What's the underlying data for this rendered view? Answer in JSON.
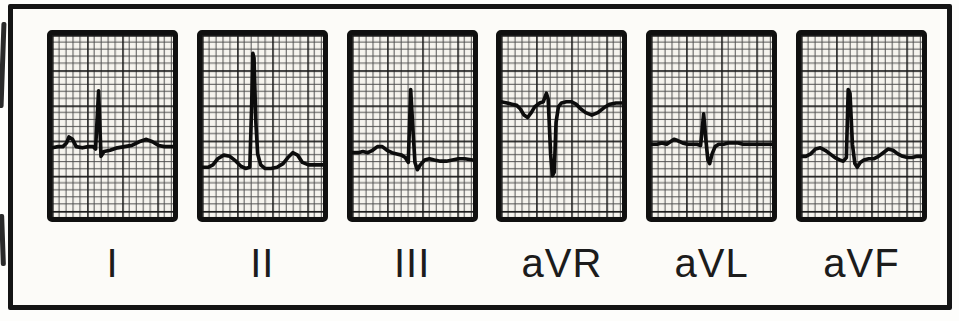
{
  "figure": {
    "colors": {
      "page_background": "#fdfdfb",
      "frame_border": "#141414",
      "frame_background": "#fcfbf8",
      "paper": "#f6f4ee",
      "grid_minor": "#4b4b4b",
      "grid_major": "#1a1a1a",
      "trace": "#0c0c0c",
      "panel_border": "#101010",
      "label_text": "#1c1c1c"
    }
  },
  "chart_data": {
    "type": "line",
    "legend_position": "below-each-panel",
    "grid": {
      "style": "ecg graph paper",
      "viewbox": [
        100,
        150
      ],
      "minor_step_units": 5.8,
      "major_every_minor": 5
    },
    "leads": [
      {
        "label": "I",
        "qrs_polarity": "positive",
        "points": [
          [
            0,
            93
          ],
          [
            5,
            92
          ],
          [
            9,
            92
          ],
          [
            12,
            89
          ],
          [
            14,
            84
          ],
          [
            17,
            86
          ],
          [
            20,
            92
          ],
          [
            25,
            93
          ],
          [
            30,
            92
          ],
          [
            34,
            92
          ],
          [
            36,
            94
          ],
          [
            38.5,
            46
          ],
          [
            40.5,
            100
          ],
          [
            43,
            96
          ],
          [
            48,
            95
          ],
          [
            54,
            93
          ],
          [
            60,
            92
          ],
          [
            66,
            91
          ],
          [
            72,
            88
          ],
          [
            78,
            86
          ],
          [
            83,
            88
          ],
          [
            88,
            91
          ],
          [
            93,
            92
          ],
          [
            100,
            92
          ]
        ]
      },
      {
        "label": "II",
        "qrs_polarity": "positive",
        "points": [
          [
            0,
            109
          ],
          [
            5,
            109
          ],
          [
            9,
            107
          ],
          [
            13,
            102
          ],
          [
            18,
            99
          ],
          [
            23,
            100
          ],
          [
            28,
            104
          ],
          [
            32,
            108
          ],
          [
            36,
            110
          ],
          [
            39.5,
            109
          ],
          [
            41,
            60
          ],
          [
            42,
            15
          ],
          [
            43,
            19
          ],
          [
            44.5,
            72
          ],
          [
            46,
            98
          ],
          [
            48.5,
            107
          ],
          [
            52,
            110
          ],
          [
            57,
            110
          ],
          [
            62,
            109
          ],
          [
            67,
            106
          ],
          [
            71,
            101
          ],
          [
            75,
            97
          ],
          [
            79,
            99
          ],
          [
            83,
            105
          ],
          [
            88,
            107
          ],
          [
            93,
            107
          ],
          [
            100,
            107
          ]
        ]
      },
      {
        "label": "III",
        "qrs_polarity": "positive",
        "points": [
          [
            0,
            97
          ],
          [
            5,
            97
          ],
          [
            9,
            96
          ],
          [
            13,
            97
          ],
          [
            17,
            95
          ],
          [
            21,
            92
          ],
          [
            25,
            92
          ],
          [
            29,
            95
          ],
          [
            33,
            97
          ],
          [
            37,
            98
          ],
          [
            41,
            99
          ],
          [
            44,
            101
          ],
          [
            46.5,
            105
          ],
          [
            48.5,
            45
          ],
          [
            50.5,
            80
          ],
          [
            52,
            105
          ],
          [
            54,
            111
          ],
          [
            56.5,
            107
          ],
          [
            60,
            103
          ],
          [
            64,
            102
          ],
          [
            68,
            103
          ],
          [
            73,
            104
          ],
          [
            78,
            104
          ],
          [
            83,
            103
          ],
          [
            88,
            102
          ],
          [
            93,
            102
          ],
          [
            100,
            103
          ]
        ]
      },
      {
        "label": "aVR",
        "qrs_polarity": "negative",
        "points": [
          [
            0,
            55
          ],
          [
            5,
            56
          ],
          [
            9,
            57
          ],
          [
            13,
            58
          ],
          [
            16,
            61
          ],
          [
            19,
            66
          ],
          [
            22,
            68
          ],
          [
            25,
            64
          ],
          [
            28,
            59
          ],
          [
            32,
            56
          ],
          [
            35,
            55
          ],
          [
            37.5,
            48
          ],
          [
            39,
            53
          ],
          [
            41,
            98
          ],
          [
            42.5,
            116
          ],
          [
            44,
            113
          ],
          [
            45.5,
            72
          ],
          [
            47.5,
            59
          ],
          [
            50,
            56
          ],
          [
            54,
            55
          ],
          [
            58,
            55
          ],
          [
            62,
            57
          ],
          [
            66,
            61
          ],
          [
            70,
            64
          ],
          [
            75,
            66
          ],
          [
            80,
            64
          ],
          [
            85,
            60
          ],
          [
            90,
            57
          ],
          [
            95,
            56
          ],
          [
            100,
            56
          ]
        ]
      },
      {
        "label": "aVL",
        "qrs_polarity": "biphasic",
        "points": [
          [
            0,
            90
          ],
          [
            5,
            90
          ],
          [
            9,
            89
          ],
          [
            13,
            90
          ],
          [
            16,
            88
          ],
          [
            19,
            86
          ],
          [
            22,
            87
          ],
          [
            26,
            89
          ],
          [
            30,
            90
          ],
          [
            34,
            90
          ],
          [
            38,
            90
          ],
          [
            41,
            91
          ],
          [
            43.5,
            65
          ],
          [
            45.5,
            88
          ],
          [
            47,
            103
          ],
          [
            48.5,
            106
          ],
          [
            50.5,
            98
          ],
          [
            53,
            92
          ],
          [
            56,
            90
          ],
          [
            60,
            90
          ],
          [
            64,
            89
          ],
          [
            68,
            89
          ],
          [
            72,
            89
          ],
          [
            76,
            90
          ],
          [
            80,
            90
          ],
          [
            85,
            90
          ],
          [
            90,
            90
          ],
          [
            95,
            90
          ],
          [
            100,
            90
          ]
        ]
      },
      {
        "label": "aVF",
        "qrs_polarity": "positive",
        "points": [
          [
            0,
            100
          ],
          [
            4,
            100
          ],
          [
            8,
            98
          ],
          [
            12,
            94
          ],
          [
            16,
            93
          ],
          [
            20,
            95
          ],
          [
            24,
            98
          ],
          [
            28,
            101
          ],
          [
            32,
            103
          ],
          [
            35,
            104
          ],
          [
            37.5,
            101
          ],
          [
            39,
            45
          ],
          [
            40.5,
            48
          ],
          [
            42.5,
            90
          ],
          [
            44.5,
            106
          ],
          [
            46.5,
            109
          ],
          [
            49,
            105
          ],
          [
            52,
            103
          ],
          [
            56,
            102
          ],
          [
            60,
            102
          ],
          [
            64,
            100
          ],
          [
            68,
            97
          ],
          [
            72,
            94
          ],
          [
            76,
            95
          ],
          [
            80,
            98
          ],
          [
            84,
            100
          ],
          [
            88,
            101
          ],
          [
            92,
            101
          ],
          [
            96,
            100
          ],
          [
            100,
            100
          ]
        ]
      }
    ]
  }
}
